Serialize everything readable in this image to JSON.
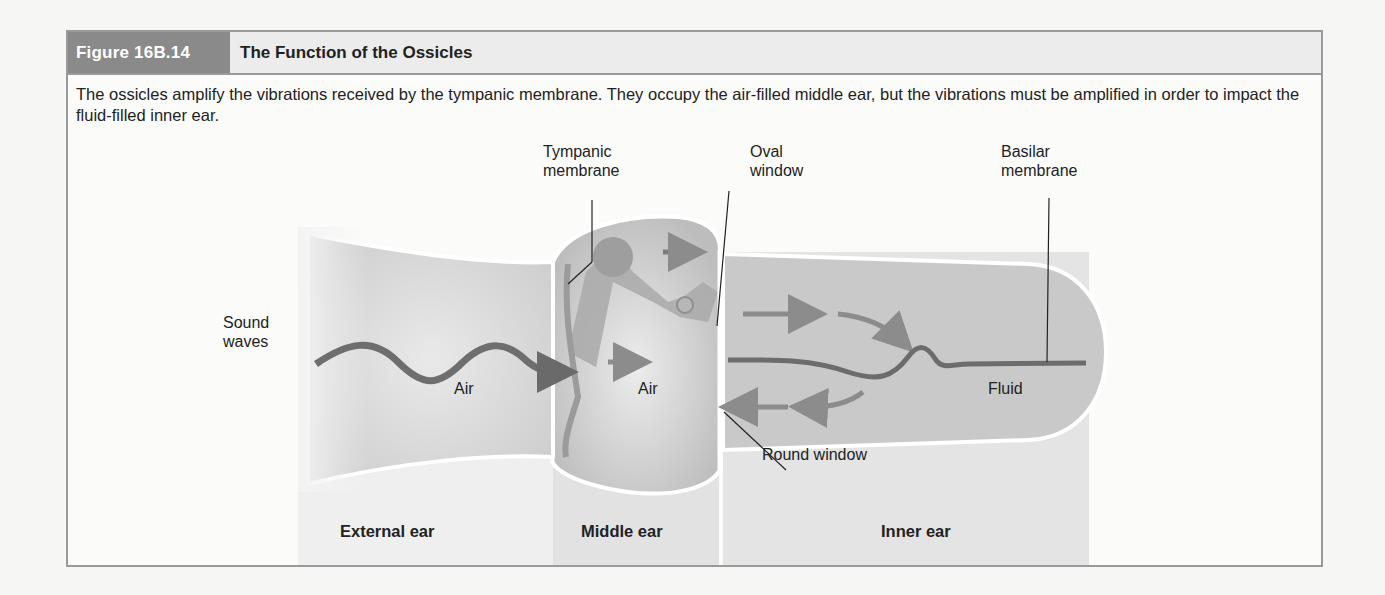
{
  "figure": {
    "number": "Figure 16B.14",
    "title": "The Function of the Ossicles",
    "caption": "The ossicles amplify the vibrations received by the tympanic membrane. They occupy the air-filled middle ear, but the vibrations must be amplified in order to impact the fluid-filled inner ear."
  },
  "diagram": {
    "callouts": {
      "tympanic_membrane_line1": "Tympanic",
      "tympanic_membrane_line2": "membrane",
      "oval_window_line1": "Oval",
      "oval_window_line2": "window",
      "basilar_membrane_line1": "Basilar",
      "basilar_membrane_line2": "membrane",
      "sound_waves_line1": "Sound",
      "sound_waves_line2": "waves",
      "round_window": "Round window"
    },
    "medium_labels": {
      "external": "Air",
      "middle": "Air",
      "inner": "Fluid"
    },
    "regions": {
      "external": "External ear",
      "middle": "Middle ear",
      "inner": "Inner ear"
    },
    "colors": {
      "header_tag": "#8a8a8a",
      "header_bg": "#ececec",
      "border": "#9a9a9a",
      "region_shade": "#e2e2e2",
      "canal": "#d6d6d6",
      "wave": "#6e6e6e",
      "arrow": "#8c8c8c"
    }
  }
}
